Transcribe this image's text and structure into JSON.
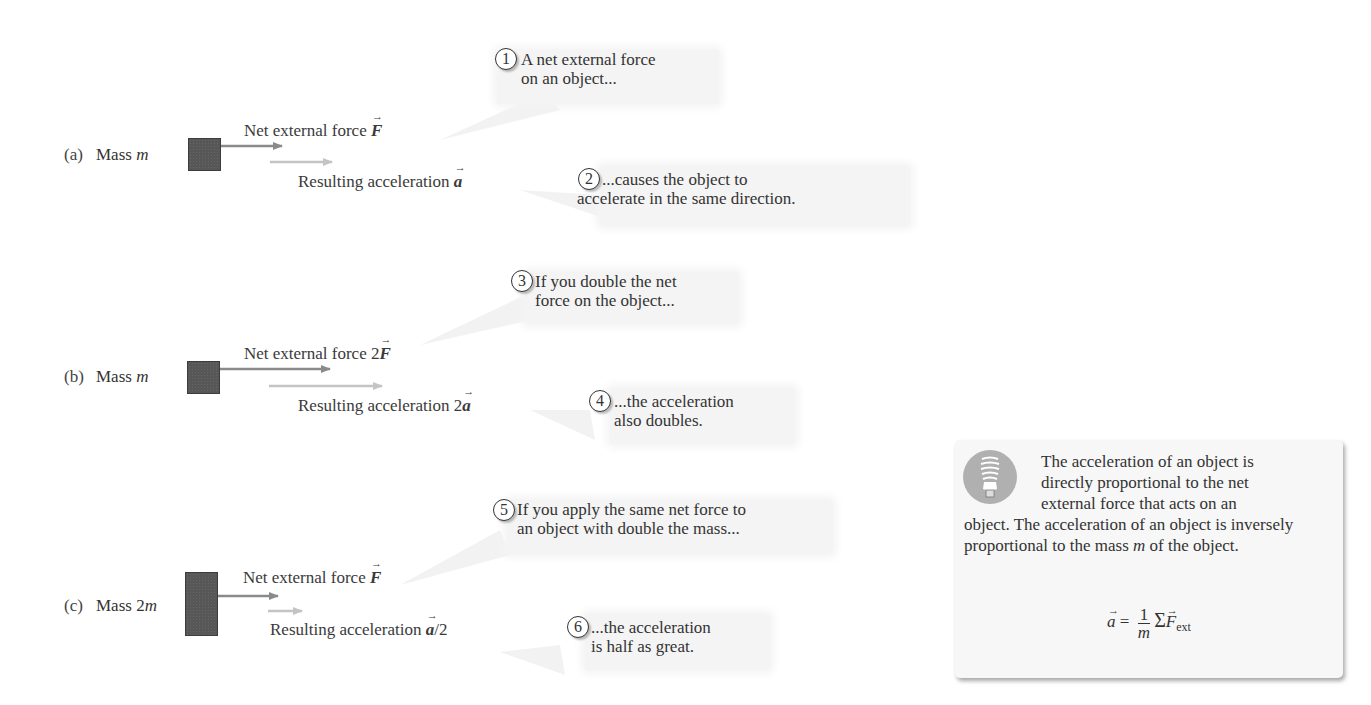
{
  "figure": {
    "panels": [
      {
        "id": "a",
        "panel_label": "(a)",
        "mass_label_prefix": "Mass ",
        "mass_symbol": "m",
        "force_label_prefix": "Net external force ",
        "force_symbol": "F",
        "accel_label_prefix": "Resulting acceleration ",
        "accel_symbol": "a",
        "accel_suffix": ""
      },
      {
        "id": "b",
        "panel_label": "(b)",
        "mass_label_prefix": "Mass ",
        "mass_symbol": "m",
        "force_label_prefix": "Net external force 2",
        "force_symbol": "F",
        "accel_label_prefix": "Resulting acceleration 2",
        "accel_symbol": "a",
        "accel_suffix": ""
      },
      {
        "id": "c",
        "panel_label": "(c)",
        "mass_label_prefix": "Mass 2",
        "mass_symbol": "m",
        "force_label_prefix": "Net external force ",
        "force_symbol": "F",
        "accel_label_prefix": "Resulting acceleration ",
        "accel_symbol": "a",
        "accel_suffix": "/2"
      }
    ],
    "callouts": [
      {
        "number": "1",
        "line1": "A net external force",
        "line2": "on an object..."
      },
      {
        "number": "2",
        "line1": "...causes the object to",
        "line2": "accelerate in the same direction."
      },
      {
        "number": "3",
        "line1": "If you double the net",
        "line2": "force on the object..."
      },
      {
        "number": "4",
        "line1": "...the acceleration",
        "line2": "also doubles."
      },
      {
        "number": "5",
        "line1": "If you apply the same net force to",
        "line2": "an object with double the mass..."
      },
      {
        "number": "6",
        "line1": "...the acceleration",
        "line2": "is half as great."
      }
    ],
    "summary": {
      "icon": "lightbulb-icon",
      "line1": "The acceleration of an object is",
      "line2": "directly proportional to the net",
      "line3": "external force that acts on an",
      "para2_before_m": "object. The acceleration of an object is inversely proportional to the mass ",
      "para2_m": "m",
      "para2_after_m": " of the object.",
      "formula": {
        "lhs": "a",
        "equals": " = ",
        "numerator": "1",
        "denominator": "m",
        "sum": "Σ",
        "force": "F",
        "subscript": "ext"
      }
    },
    "colors": {
      "block": "#575757",
      "force_arrow": "#8a8a8a",
      "accel_arrow": "#c4c4c4",
      "callout_bg": "#f4f4f4",
      "summary_bg": "#f7f7f7",
      "bulb_circle": "#b0b0b0"
    }
  }
}
